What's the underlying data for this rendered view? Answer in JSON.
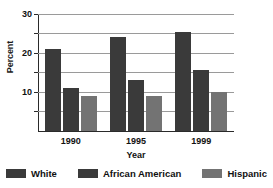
{
  "chart_data": {
    "type": "bar",
    "title": "",
    "xlabel": "Year",
    "ylabel": "Percent",
    "categories": [
      "1990",
      "1995",
      "1999"
    ],
    "series": [
      {
        "name": "White",
        "values": [
          21,
          24,
          25.5
        ],
        "color": "#3a3a3a"
      },
      {
        "name": "African American",
        "values": [
          11,
          13,
          15.5
        ],
        "color": "#3a3a3a"
      },
      {
        "name": "Hispanic",
        "values": [
          9,
          9,
          10
        ],
        "color": "#737373"
      }
    ],
    "ylim": [
      0,
      30
    ],
    "ytick_labels": [
      "10",
      "20",
      "30"
    ],
    "ytick_values": [
      10,
      20,
      30
    ],
    "gridline_values": [
      5,
      10,
      15,
      20,
      25,
      30
    ],
    "grid": true,
    "legend_position": "bottom"
  },
  "axis": {
    "y_title": "Percent",
    "x_title": "Year"
  },
  "legend": {
    "items": [
      {
        "label": "White",
        "swatch_color": "#3a3a3a",
        "swatch_name": "legend-swatch-white"
      },
      {
        "label": "African American",
        "swatch_color": "#3a3a3a",
        "swatch_name": "legend-swatch-african-american"
      },
      {
        "label": "Hispanic",
        "swatch_color": "#737373",
        "swatch_name": "legend-swatch-hispanic"
      }
    ]
  }
}
